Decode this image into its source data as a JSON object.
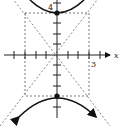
{
  "diagram": {
    "type": "hyperbola-graph",
    "equation_hint": "vertical hyperbola, a=4, b=3",
    "labels": {
      "x_axis": "x",
      "vertex_label": "4",
      "x_tick_label": "3"
    },
    "vertices": [
      [
        0,
        4
      ],
      [
        0,
        -4
      ]
    ],
    "asymptote_box": {
      "x": [
        -3,
        3
      ],
      "y": [
        -4,
        4
      ]
    },
    "colors": {
      "curve": "#111111",
      "dashed": "#555555",
      "axis": "#222222"
    }
  }
}
